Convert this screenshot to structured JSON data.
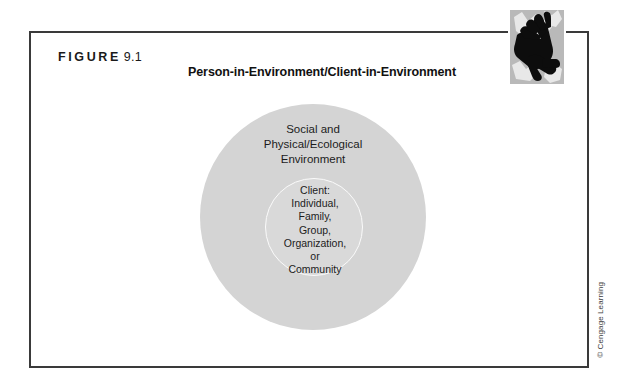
{
  "figure": {
    "label_word": "FIGURE",
    "label_number": "9.1",
    "title": "Person-in-Environment/Client-in-Environment"
  },
  "diagram": {
    "type": "concentric-circles",
    "outer_circle": {
      "name": "social-environment",
      "lines": [
        "Social and",
        "Physical/Ecological",
        "Environment"
      ],
      "text": "Social and\nPhysical/Ecological\nEnvironment",
      "fill_color": "#d4d4d4"
    },
    "inner_circle": {
      "name": "client-system",
      "lines": [
        "Client:",
        "Individual,",
        "Family,",
        "Group,",
        "Organization,",
        "or",
        "Community"
      ],
      "text": "Client:\nIndividual,\nFamily,\nGroup,\nOrganization,\nor\nCommunity",
      "fill_color": "#d9d9d9",
      "ring_color": "#fbfbfb"
    }
  },
  "decoration": {
    "hands_image_alt": "hands-illustration"
  },
  "credit": {
    "text": "© Cengage Learning"
  },
  "colors": {
    "frame_border": "#3a3a3a",
    "page_background": "#ffffff",
    "text": "#1a1a1a"
  }
}
